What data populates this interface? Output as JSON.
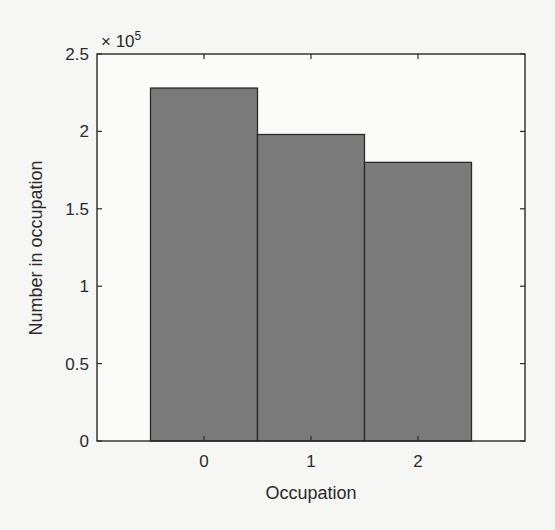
{
  "chart_data": {
    "type": "bar",
    "title": "",
    "xlabel": "Occupation",
    "ylabel": "Number in occupation",
    "y_exponent_label": "× 10",
    "y_exponent_power": "5",
    "categories": [
      "0",
      "1",
      "2"
    ],
    "values": [
      228000,
      198000,
      180000
    ],
    "ylim": [
      0,
      250000
    ],
    "xlim": [
      -1,
      3
    ],
    "yticks": [
      0,
      50000,
      100000,
      150000,
      200000,
      250000
    ],
    "ytick_labels": [
      "0",
      "0.5",
      "1",
      "1.5",
      "2",
      "2.5"
    ],
    "xtick_labels": [
      "0",
      "1",
      "2"
    ],
    "grid": false,
    "legend": null,
    "bar_color": "#7a7a7a",
    "bar_edge_color": "#2a2a2a",
    "bar_width": 1.0
  }
}
